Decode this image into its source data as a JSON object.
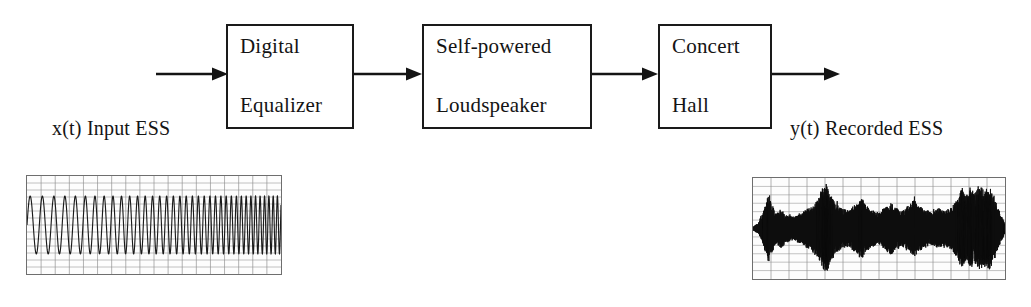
{
  "figure": {
    "type": "block-diagram"
  },
  "blocks": [
    {
      "id": "equalizer",
      "line1": "Digital",
      "line2": "Equalizer"
    },
    {
      "id": "loudspeaker",
      "line1": "Self-powered",
      "line2": "Loudspeaker"
    },
    {
      "id": "hall",
      "line1": "Concert",
      "line2": "Hall"
    }
  ],
  "labels": {
    "input": "x(t) Input ESS",
    "output": "y(t) Recorded ESS"
  },
  "arrows": [
    {
      "id": "input-arrow",
      "from": "source",
      "to": "equalizer"
    },
    {
      "id": "equalizer-to-speaker",
      "from": "equalizer",
      "to": "loudspeaker"
    },
    {
      "id": "speaker-to-hall",
      "from": "loudspeaker",
      "to": "hall"
    },
    {
      "id": "output-arrow",
      "from": "hall",
      "to": "recording"
    }
  ],
  "waveforms": {
    "input": {
      "name": "input-ess-waveform",
      "kind": "exponential-sine-sweep",
      "grid": true,
      "grid_cols": 18,
      "grid_rows": 14,
      "stroke": "#1b1b1b"
    },
    "output": {
      "name": "recorded-ess-waveform",
      "kind": "recorded-room-response",
      "grid": true,
      "grid_cols": 14,
      "grid_rows": 12,
      "stroke": "#0d0d0d"
    }
  },
  "colors": {
    "ink": "#141414",
    "box_border": "#1a1a1a",
    "grid": "#8e8e8e",
    "panel_border": "#6e6e6e",
    "background": "#ffffff"
  },
  "chart_data": {
    "type": "line",
    "title": "",
    "xlabel": "",
    "ylabel": "",
    "panels": [
      {
        "name": "x(t) Input ESS",
        "type": "line",
        "xlim": [
          0,
          1
        ],
        "ylim": [
          -1,
          1
        ],
        "note": "Exponential sine sweep, constant amplitude, increasing frequency"
      },
      {
        "name": "y(t) Recorded ESS",
        "type": "line",
        "xlim": [
          0,
          1
        ],
        "ylim": [
          -1,
          1
        ],
        "note": "Recorded sweep through loudspeaker and concert hall, amplitude modulated by room response"
      }
    ]
  }
}
